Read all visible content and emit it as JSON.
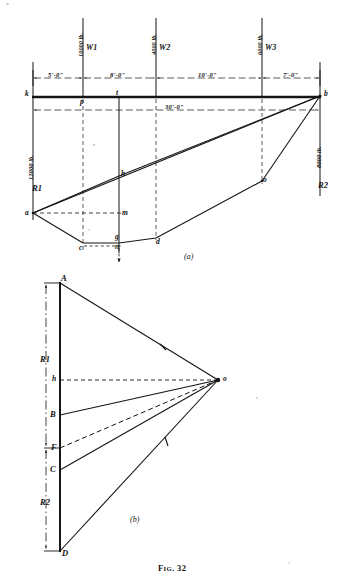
{
  "figure": {
    "caption_prefix": "F",
    "caption_smallcaps": "IG",
    "caption_number": ". 32",
    "caption_full": "FIG. 32",
    "panel_a_label": "(a)",
    "panel_b_label": "(b)"
  },
  "diagram_a": {
    "title": "space diagram and funicular polygon",
    "beam_points": [
      {
        "name": "k",
        "label": "k",
        "x": 33,
        "y": 96
      },
      {
        "name": "p",
        "label": "p",
        "x": 83,
        "y": 96
      },
      {
        "name": "t",
        "label": "t",
        "x": 119,
        "y": 96
      },
      {
        "name": "b",
        "label": "b",
        "x": 320,
        "y": 96
      }
    ],
    "string_points": [
      {
        "name": "a",
        "label": "a",
        "x": 33,
        "y": 213
      },
      {
        "name": "c",
        "label": "c",
        "x": 83,
        "y": 243
      },
      {
        "name": "g",
        "label": "g",
        "x": 119,
        "y": 236
      },
      {
        "name": "n",
        "label": "n",
        "x": 119,
        "y": 245
      },
      {
        "name": "m",
        "label": "m",
        "x": 119,
        "y": 213
      },
      {
        "name": "h",
        "label": "h",
        "x": 119,
        "y": 176
      },
      {
        "name": "d",
        "label": "d",
        "x": 156,
        "y": 238
      },
      {
        "name": "o",
        "label": "o",
        "x": 262,
        "y": 181
      }
    ],
    "loads": [
      {
        "name": "W1",
        "label": "W",
        "sub": "1",
        "magnitude": "10000 lb.",
        "x": 83
      },
      {
        "name": "W2",
        "label": "W",
        "sub": "2",
        "magnitude": "4000 lb.",
        "x": 156
      },
      {
        "name": "W3",
        "label": "W",
        "sub": "3",
        "magnitude": "6000 lb.",
        "x": 262
      }
    ],
    "reactions": [
      {
        "name": "R1",
        "label": "R",
        "sub": "1",
        "magnitude": "12000 lb.",
        "x": 33
      },
      {
        "name": "R2",
        "label": "R",
        "sub": "2",
        "magnitude": "8000 lb.",
        "x": 320
      }
    ],
    "dimensions": [
      {
        "name": "dim-k-W1",
        "text": "5'-0\"",
        "from_x": 33,
        "to_x": 83
      },
      {
        "name": "dim-W1-W2",
        "text": "8'-0\"",
        "from_x": 83,
        "to_x": 156
      },
      {
        "name": "dim-W2-W3",
        "text": "10'-0\"",
        "from_x": 156,
        "to_x": 262
      },
      {
        "name": "dim-W3-b",
        "text": "7'-0\"",
        "from_x": 262,
        "to_x": 320
      }
    ],
    "span": {
      "name": "overall-span",
      "text": "30'-0\"",
      "from_x": 33,
      "to_x": 320
    }
  },
  "diagram_b": {
    "title": "force polygon",
    "load_line_points": [
      {
        "name": "A",
        "label": "A",
        "x": 60,
        "y": 283
      },
      {
        "name": "h",
        "label": "h",
        "x": 60,
        "y": 380
      },
      {
        "name": "B",
        "label": "B",
        "x": 60,
        "y": 415
      },
      {
        "name": "F",
        "label": "F",
        "x": 60,
        "y": 448
      },
      {
        "name": "C",
        "label": "C",
        "x": 60,
        "y": 470
      },
      {
        "name": "D",
        "label": "D",
        "x": 60,
        "y": 551
      }
    ],
    "pole": {
      "name": "o",
      "label": "o",
      "x": 218,
      "y": 380
    },
    "reaction_brackets": [
      {
        "name": "R1-bracket",
        "label": "R",
        "sub": "1",
        "from_y": 283,
        "to_y": 448
      },
      {
        "name": "R2-bracket",
        "label": "R",
        "sub": "2",
        "from_y": 448,
        "to_y": 551
      }
    ]
  },
  "colors": {
    "ink": "#1a1a1a",
    "line": "#151515",
    "paper": "#ffffff"
  }
}
